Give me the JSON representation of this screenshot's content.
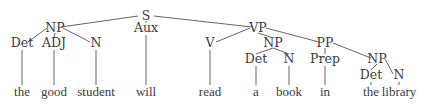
{
  "diagram": {
    "type": "syntax-tree",
    "colors": {
      "text": "#3a3a3a",
      "line": "#555555",
      "background": "#ffffff"
    },
    "nodes": [
      {
        "id": "S",
        "label": "S",
        "x": 146,
        "y": 20
      },
      {
        "id": "NP1",
        "label": "NP",
        "x": 55,
        "y": 32
      },
      {
        "id": "Aux",
        "label": "Aux",
        "x": 146,
        "y": 32
      },
      {
        "id": "VP",
        "label": "VP",
        "x": 258,
        "y": 32
      },
      {
        "id": "Det1",
        "label": "Det",
        "x": 22,
        "y": 47
      },
      {
        "id": "ADJ",
        "label": "ADJ",
        "x": 54,
        "y": 47
      },
      {
        "id": "N1",
        "label": "N",
        "x": 96,
        "y": 47
      },
      {
        "id": "V",
        "label": "V",
        "x": 210,
        "y": 47
      },
      {
        "id": "NP2",
        "label": "NP",
        "x": 273,
        "y": 47
      },
      {
        "id": "PP",
        "label": "PP",
        "x": 325,
        "y": 47
      },
      {
        "id": "Det2",
        "label": "Det",
        "x": 256,
        "y": 63
      },
      {
        "id": "N2",
        "label": "N",
        "x": 289,
        "y": 63
      },
      {
        "id": "Prep",
        "label": "Prep",
        "x": 325,
        "y": 63
      },
      {
        "id": "NP3",
        "label": "NP",
        "x": 377,
        "y": 63
      },
      {
        "id": "Det3",
        "label": "Det",
        "x": 371,
        "y": 79
      },
      {
        "id": "N3",
        "label": "N",
        "x": 399,
        "y": 79
      }
    ],
    "words": [
      {
        "text": "the",
        "x": 22,
        "parent": "Det1"
      },
      {
        "text": "good",
        "x": 54,
        "parent": "ADJ"
      },
      {
        "text": "student",
        "x": 96,
        "parent": "N1"
      },
      {
        "text": "will",
        "x": 146,
        "parent": "Aux"
      },
      {
        "text": "read",
        "x": 210,
        "parent": "V"
      },
      {
        "text": "a",
        "x": 256,
        "parent": "Det2"
      },
      {
        "text": "book",
        "x": 289,
        "parent": "N2"
      },
      {
        "text": "in",
        "x": 325,
        "parent": "Prep"
      },
      {
        "text": "the",
        "x": 371,
        "parent": "Det3"
      },
      {
        "text": "library",
        "x": 399,
        "parent": "N3"
      }
    ],
    "word_baseline_y": 96,
    "edges": [
      [
        "S",
        "NP1"
      ],
      [
        "S",
        "Aux"
      ],
      [
        "S",
        "VP"
      ],
      [
        "NP1",
        "Det1"
      ],
      [
        "NP1",
        "ADJ"
      ],
      [
        "NP1",
        "N1"
      ],
      [
        "VP",
        "V"
      ],
      [
        "VP",
        "NP2"
      ],
      [
        "VP",
        "PP"
      ],
      [
        "NP2",
        "Det2"
      ],
      [
        "NP2",
        "N2"
      ],
      [
        "PP",
        "Prep"
      ],
      [
        "PP",
        "NP3"
      ],
      [
        "NP3",
        "Det3"
      ],
      [
        "NP3",
        "N3"
      ]
    ]
  }
}
